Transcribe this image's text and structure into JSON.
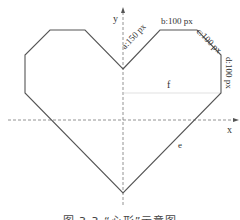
{
  "figure": {
    "axes": {
      "x_label": "x",
      "y_label": "y"
    },
    "segments": {
      "a": "a:150 px",
      "b": "b:100 px",
      "c": "c:100 px",
      "d": "d:100 px",
      "e": "e",
      "f": "f"
    },
    "caption": "图 3.3 “心形”示意图",
    "colors": {
      "outline": "#555555",
      "axis": "#777777",
      "guide": "#cccccc"
    }
  }
}
